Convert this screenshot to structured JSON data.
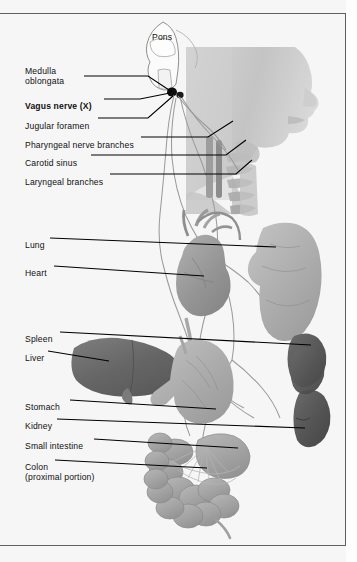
{
  "figure": {
    "background_color": "#f6f6f6",
    "rule_color": "#5d6066",
    "leader_color": "#000000",
    "nerve_color": "#9a9a9a"
  },
  "inline_labels": [
    {
      "id": "pons",
      "text": "Pons",
      "x": 152,
      "y": 32
    }
  ],
  "labels": [
    {
      "id": "medulla-oblongata",
      "text": "Medulla\noblongata",
      "x": 25,
      "y": 66,
      "bold": false
    },
    {
      "id": "vagus-nerve",
      "text": "Vagus nerve (X)",
      "x": 25,
      "y": 101,
      "bold": true
    },
    {
      "id": "jugular-foramen",
      "text": "Jugular foramen",
      "x": 25,
      "y": 121,
      "bold": false
    },
    {
      "id": "pharyngeal-nerve-branches",
      "text": "Pharyngeal nerve branches",
      "x": 25,
      "y": 140,
      "bold": false
    },
    {
      "id": "carotid-sinus",
      "text": "Carotid sinus",
      "x": 25,
      "y": 158,
      "bold": false
    },
    {
      "id": "laryngeal-branches",
      "text": "Laryngeal branches",
      "x": 25,
      "y": 177,
      "bold": false
    },
    {
      "id": "lung",
      "text": "Lung",
      "x": 25,
      "y": 240,
      "bold": false
    },
    {
      "id": "heart",
      "text": "Heart",
      "x": 25,
      "y": 268,
      "bold": false
    },
    {
      "id": "spleen",
      "text": "Spleen",
      "x": 25,
      "y": 334,
      "bold": false
    },
    {
      "id": "liver",
      "text": "Liver",
      "x": 25,
      "y": 353,
      "bold": false
    },
    {
      "id": "stomach",
      "text": "Stomach",
      "x": 25,
      "y": 402,
      "bold": false
    },
    {
      "id": "kidney",
      "text": "Kidney",
      "x": 25,
      "y": 421,
      "bold": false
    },
    {
      "id": "small-intestine",
      "text": "Small intestine",
      "x": 25,
      "y": 441,
      "bold": false
    },
    {
      "id": "colon",
      "text": "Colon\n(proximal portion)",
      "x": 25,
      "y": 462,
      "bold": false
    }
  ],
  "leader_lines": [
    {
      "id": "leader-medulla",
      "points": "84,76 148,76 172,92"
    },
    {
      "id": "leader-vagus",
      "points": "104,99 140,99 170,93"
    },
    {
      "id": "leader-jugular",
      "points": "98,118 148,118 173,96"
    },
    {
      "id": "leader-pharyngeal",
      "points": "141,137 208,137 233,121"
    },
    {
      "id": "leader-carotid",
      "points": "91,155 226,155 246,140"
    },
    {
      "id": "leader-laryngeal",
      "points": "110,174 236,174 252,160"
    },
    {
      "id": "leader-lung",
      "points": "50,238 276,247"
    },
    {
      "id": "leader-heart",
      "points": "54,266 204,276"
    },
    {
      "id": "leader-spleen",
      "points": "60,332 311,345"
    },
    {
      "id": "leader-liver",
      "points": "48,351 109,361"
    },
    {
      "id": "leader-stomach",
      "points": "70,400 216,409"
    },
    {
      "id": "leader-kidney",
      "points": "57,419 305,428"
    },
    {
      "id": "leader-small-int",
      "points": "94,439 238,448"
    },
    {
      "id": "leader-colon",
      "points": "55,460 207,468"
    }
  ],
  "anatomy": {
    "head": {
      "name": "head-profile",
      "fill": "#c9c9c9"
    },
    "brainstem": {
      "name": "brainstem-outline",
      "stroke": "#8d8d8d"
    },
    "lung": {
      "name": "lung",
      "fill": "#b4b4b4"
    },
    "heart": {
      "name": "heart",
      "fill": "#a2a2a2"
    },
    "liver": {
      "name": "liver",
      "fill": "#6f6f6f"
    },
    "spleen": {
      "name": "spleen",
      "fill": "#5e5e5e"
    },
    "stomach": {
      "name": "stomach",
      "fill": "#b0b0b0"
    },
    "kidney": {
      "name": "kidney",
      "fill": "#5a5a5a"
    },
    "colon": {
      "name": "colon",
      "fill": "#a9a9a9"
    },
    "vertebrae": {
      "name": "cervical-vertebrae",
      "fill": "#b8b8b8"
    },
    "nerve_trunks": {
      "name": "vagus-nerve-trunks",
      "stroke": "#9a9a9a"
    }
  }
}
